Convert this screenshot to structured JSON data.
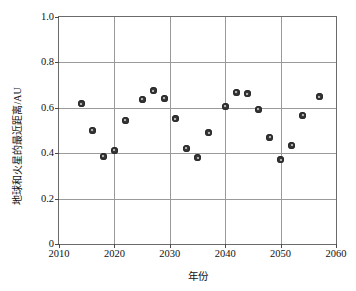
{
  "chart_data": {
    "type": "scatter",
    "title": "",
    "xlabel": "年份",
    "ylabel": "地球和火星的最近距离/AU",
    "xlim": [
      2010,
      2060
    ],
    "ylim": [
      0,
      1.0
    ],
    "grid": true,
    "legend": "none",
    "marker": "filled-circle",
    "xticks": [
      "2010",
      "2020",
      "2030",
      "2040",
      "2050",
      "2060"
    ],
    "xtick_values": [
      2010,
      2020,
      2030,
      2040,
      2050,
      2060
    ],
    "yticks": [
      "0",
      "0.2",
      "0.4",
      "0.6",
      "0.8",
      "1.0"
    ],
    "ytick_values": [
      0,
      0.2,
      0.4,
      0.6,
      0.8,
      1.0
    ],
    "points": [
      {
        "x": 2014,
        "y": 0.617
      },
      {
        "x": 2016,
        "y": 0.502
      },
      {
        "x": 2018,
        "y": 0.387
      },
      {
        "x": 2020,
        "y": 0.414
      },
      {
        "x": 2022,
        "y": 0.545
      },
      {
        "x": 2025,
        "y": 0.637
      },
      {
        "x": 2027,
        "y": 0.676
      },
      {
        "x": 2029,
        "y": 0.643
      },
      {
        "x": 2031,
        "y": 0.551
      },
      {
        "x": 2033,
        "y": 0.421
      },
      {
        "x": 2035,
        "y": 0.379
      },
      {
        "x": 2037,
        "y": 0.49
      },
      {
        "x": 2040,
        "y": 0.606
      },
      {
        "x": 2042,
        "y": 0.668
      },
      {
        "x": 2044,
        "y": 0.661
      },
      {
        "x": 2046,
        "y": 0.594
      },
      {
        "x": 2048,
        "y": 0.47
      },
      {
        "x": 2050,
        "y": 0.372
      },
      {
        "x": 2052,
        "y": 0.435
      },
      {
        "x": 2054,
        "y": 0.567
      },
      {
        "x": 2057,
        "y": 0.648
      }
    ]
  }
}
